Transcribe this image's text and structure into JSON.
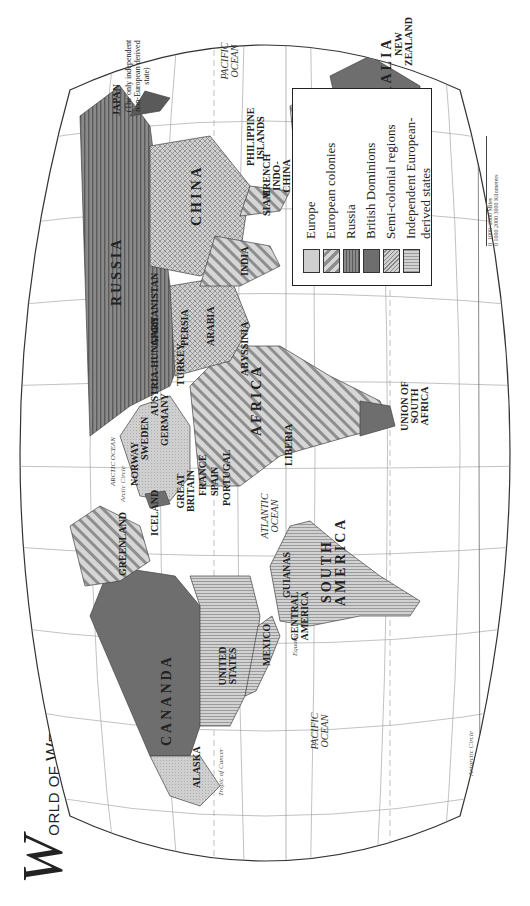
{
  "title": {
    "initial": "W",
    "rest_small1": "ORLD OF ",
    "rest_cap2": "W",
    "rest_small2": "ESTERN ",
    "rest_cap3": "D",
    "rest_small3": "OMINANCE: 1914"
  },
  "legend": {
    "items": [
      {
        "label": "Europe",
        "pattern": "dots-light",
        "color": "#c8c8c8"
      },
      {
        "label": "European colonies",
        "pattern": "diagonal",
        "color": "#b0b0b0"
      },
      {
        "label": "Russia",
        "pattern": "horizontal",
        "color": "#808080"
      },
      {
        "label": "British Dominions",
        "pattern": "solid",
        "color": "#6e6e6e"
      },
      {
        "label": "Semi-colonial regions",
        "pattern": "crosshatch",
        "color": "#b8b8b8"
      },
      {
        "label": "Independent European-derived states",
        "pattern": "vertical",
        "color": "#c4c4c4"
      }
    ]
  },
  "regions": {
    "russia": "RUSSIA",
    "china": "CHINA",
    "india": "INDIA",
    "africa": "AFRICA",
    "south_america": "SOUTH AMERICA",
    "canada": "CANANDA",
    "united_states": "UNITED STATES",
    "australia": "AUSTRALIA",
    "alaska": "ALASKA",
    "mexico": "MEXICO",
    "central_america": "CENTRAL AMERICA",
    "guianas": "GUIANAS",
    "greenland": "GREENLAND",
    "iceland": "ICELAND",
    "great_britain": "GREAT BRITAIN",
    "france": "FRANCE",
    "spain": "SPAIN",
    "portugal": "PORTUGAL",
    "norway": "NORWAY",
    "sweden": "SWEDEN",
    "germany": "GERMANY",
    "austria_hungary": "AUSTRIA-HUNGARY",
    "turkey": "TURKEY",
    "persia": "PERSIA",
    "arabia": "ARABIA",
    "afghanistan": "AFGHANISTAN",
    "abyssinia": "ABYSSINIA",
    "liberia": "LIBERIA",
    "union_south_africa": "UNION OF SOUTH AFRICA",
    "japan": "JAPAN",
    "japan_note": "(The only independent non-European derived state)",
    "philippine": "PHILIPPINE ISLANDS",
    "french_indochina": "FRENCH INDO-CHINA",
    "siam": "SIAM",
    "dutch_east_indies": "DUTCH EAST INDIES",
    "new_zealand": "NEW ZEALAND"
  },
  "oceans": {
    "pacific_west": "PACIFIC OCEAN",
    "pacific_east": "PACIFIC OCEAN",
    "atlantic": "ATLANTIC OCEAN",
    "indian": "INDIAN OCEAN",
    "arctic": "ARCTIC OCEAN"
  },
  "lines": {
    "equator": "Equator",
    "tropic_cancer": "Tropic of Cancer",
    "tropic_capricorn": "Tropic of Capricorn",
    "arctic_circle": "Arctic Circle",
    "antarctic_circle": "Antarctic Circle"
  },
  "scale": {
    "miles": [
      "0",
      "1000",
      "2000 Miles"
    ],
    "km": [
      "0",
      "1000",
      "2000",
      "3000 Kilometers"
    ]
  }
}
